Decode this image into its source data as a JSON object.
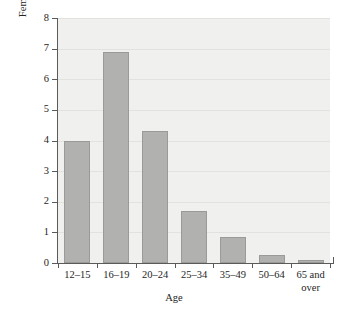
{
  "chart_data": {
    "type": "bar",
    "title": "",
    "xlabel": "Age",
    "ylabel": "Females raped or sexually assaulted annually, per 1000",
    "ylabel_lines": [
      "Females raped or sexually assaulted",
      "annually, per 1000"
    ],
    "categories": [
      "12–15",
      "16–19",
      "20–24",
      "25–34",
      "35–49",
      "50–64",
      "65 and over"
    ],
    "category_lines": [
      [
        "12–15"
      ],
      [
        "16–19"
      ],
      [
        "20–24"
      ],
      [
        "25–34"
      ],
      [
        "35–49"
      ],
      [
        "50–64"
      ],
      [
        "65 and",
        "over"
      ]
    ],
    "values": [
      4.0,
      6.9,
      4.3,
      1.7,
      0.85,
      0.25,
      0.1
    ],
    "ylim": [
      0,
      8
    ],
    "yticks": [
      0,
      1,
      2,
      3,
      4,
      5,
      6,
      7,
      8
    ],
    "ytick_labels": [
      "0",
      "1",
      "2",
      "3",
      "4",
      "5",
      "6",
      "7",
      "8"
    ],
    "grid": true,
    "grid_axis": "y",
    "legend": false,
    "legend_position": "none",
    "colors": {
      "bar_fill": "#b1b1af",
      "bar_edge": "#9a9a98",
      "plot_background": "#f0f0ee",
      "gridline": "#e2e2df",
      "axis": "#5a5a5a",
      "text": "#262626",
      "figure_background": "#ffffff"
    }
  }
}
